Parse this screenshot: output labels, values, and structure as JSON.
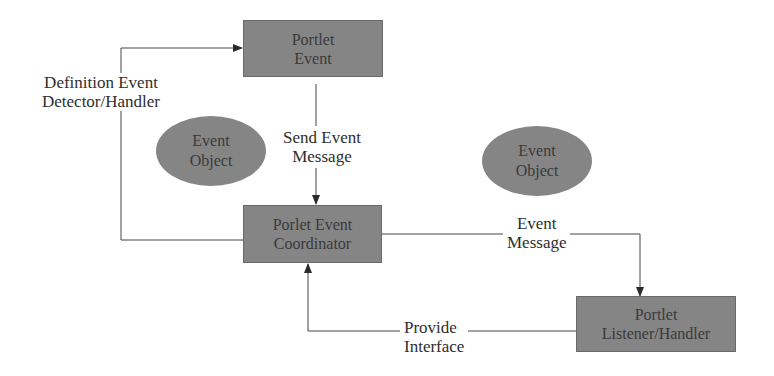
{
  "nodes": {
    "portlet_event": {
      "line1": "Portlet",
      "line2": "Event"
    },
    "coordinator": {
      "line1": "Porlet Event",
      "line2": "Coordinator"
    },
    "listener": {
      "line1": "Portlet",
      "line2": "Listener/Handler"
    },
    "event_object_1": {
      "line1": "Event",
      "line2": "Object"
    },
    "event_object_2": {
      "line1": "Event",
      "line2": "Object"
    }
  },
  "edges": {
    "definition": {
      "line1": "Definition  Event",
      "line2": "Detector/Handler"
    },
    "send": {
      "line1": "Send  Event",
      "line2": "Message"
    },
    "event_message": {
      "line1": "Event",
      "line2": "Message"
    },
    "provide": {
      "line1": "Provide",
      "line2": "Interface"
    }
  },
  "colors": {
    "node_fill": "#858585",
    "line": "#333333",
    "background": "#ffffff"
  }
}
